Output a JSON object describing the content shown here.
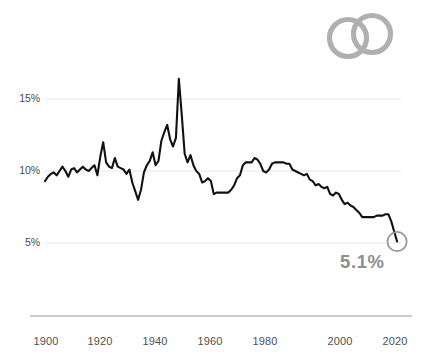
{
  "logo": {
    "name": "two-interlocking-rings-logo",
    "color": "#b0b0b0"
  },
  "callout": {
    "value_label": "5.1%",
    "color": "#8e8e8e",
    "marker": "open-circle"
  },
  "axis": {
    "y_ticks": [
      "15%",
      "10%",
      "5%"
    ],
    "x_ticks": [
      "1900",
      "1920",
      "1940",
      "1960",
      "1980",
      "2000",
      "2020"
    ],
    "gridline_color": "#e8e8e8",
    "baseline_color": "#9a9a9a"
  },
  "chart_data": {
    "type": "line",
    "title": "",
    "subtitle": "",
    "xlabel": "",
    "ylabel": "",
    "xlim": [
      1900,
      2022
    ],
    "ylim": [
      3.5,
      17.5
    ],
    "yticks": [
      5,
      10,
      15
    ],
    "ytick_labels": [
      "5%",
      "10%",
      "15%"
    ],
    "xticks": [
      1900,
      1920,
      1940,
      1960,
      1980,
      2000,
      2020
    ],
    "xtick_labels": [
      "1900",
      "1920",
      "1940",
      "1960",
      "1980",
      "2000",
      "2020"
    ],
    "grid": "horizontal",
    "legend": "none",
    "line_color": "#111111",
    "line_width": 2.1,
    "annotations": [
      {
        "text": "5.1%",
        "x": 2021,
        "y": 5.1,
        "marker": "open-circle",
        "color": "#8e8e8e"
      }
    ],
    "series": [
      {
        "name": "rate",
        "x": [
          1900,
          1901,
          1902,
          1903,
          1904,
          1905,
          1906,
          1907,
          1908,
          1909,
          1910,
          1911,
          1912,
          1913,
          1914,
          1915,
          1916,
          1917,
          1918,
          1919,
          1920,
          1921,
          1922,
          1923,
          1924,
          1925,
          1926,
          1927,
          1928,
          1929,
          1930,
          1931,
          1932,
          1933,
          1934,
          1935,
          1936,
          1937,
          1938,
          1939,
          1940,
          1941,
          1942,
          1943,
          1944,
          1945,
          1946,
          1947,
          1948,
          1949,
          1950,
          1951,
          1952,
          1953,
          1954,
          1955,
          1956,
          1957,
          1958,
          1959,
          1960,
          1961,
          1962,
          1963,
          1964,
          1965,
          1966,
          1967,
          1968,
          1969,
          1970,
          1971,
          1972,
          1973,
          1974,
          1975,
          1976,
          1977,
          1978,
          1979,
          1980,
          1981,
          1982,
          1983,
          1984,
          1985,
          1986,
          1987,
          1988,
          1989,
          1990,
          1991,
          1992,
          1993,
          1994,
          1995,
          1996,
          1997,
          1998,
          1999,
          2000,
          2001,
          2002,
          2003,
          2004,
          2005,
          2006,
          2007,
          2008,
          2009,
          2010,
          2011,
          2012,
          2013,
          2014,
          2015,
          2016,
          2017,
          2018,
          2019,
          2020,
          2021
        ],
        "y": [
          9.3,
          9.6,
          9.8,
          9.9,
          9.7,
          10.0,
          10.3,
          10.0,
          9.6,
          10.1,
          10.2,
          9.9,
          10.1,
          10.3,
          10.1,
          10.0,
          10.2,
          10.4,
          9.7,
          11.0,
          12.0,
          10.6,
          10.3,
          10.2,
          10.9,
          10.3,
          10.2,
          10.1,
          9.8,
          10.1,
          9.2,
          8.6,
          8.0,
          8.7,
          9.9,
          10.4,
          10.7,
          11.3,
          10.4,
          10.7,
          12.1,
          12.7,
          13.2,
          12.2,
          11.7,
          12.3,
          16.4,
          13.9,
          11.2,
          10.6,
          11.1,
          10.4,
          10.0,
          9.8,
          9.2,
          9.3,
          9.5,
          9.3,
          8.4,
          8.5,
          8.5,
          8.5,
          8.5,
          8.5,
          8.7,
          9.0,
          9.5,
          9.7,
          10.4,
          10.6,
          10.6,
          10.6,
          10.9,
          10.8,
          10.5,
          10.0,
          9.9,
          10.1,
          10.5,
          10.6,
          10.6,
          10.6,
          10.6,
          10.5,
          10.5,
          10.1,
          10.0,
          9.9,
          9.8,
          9.7,
          9.8,
          9.4,
          9.3,
          9.0,
          9.1,
          8.9,
          8.8,
          8.9,
          8.4,
          8.3,
          8.5,
          8.4,
          8.0,
          7.7,
          7.8,
          7.6,
          7.5,
          7.3,
          7.1,
          6.8,
          6.8,
          6.8,
          6.8,
          6.8,
          6.9,
          6.9,
          6.9,
          7.0,
          7.0,
          6.5,
          5.8,
          5.1
        ]
      }
    ]
  }
}
